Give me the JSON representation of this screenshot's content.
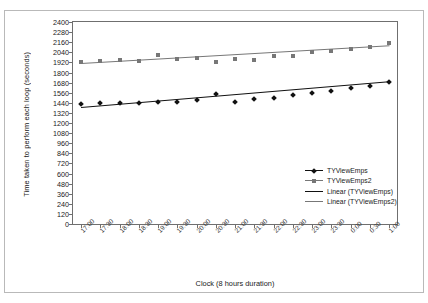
{
  "chart_data": {
    "type": "scatter",
    "title": "",
    "xlabel": "Clock (8 hours duration)",
    "ylabel": "Time taken to perform each loop (seconds)",
    "ylim": [
      0,
      2400
    ],
    "ytick_step": 120,
    "yticks": [
      2400,
      2280,
      2160,
      2040,
      1920,
      1800,
      1680,
      1560,
      1440,
      1320,
      1200,
      1080,
      960,
      840,
      720,
      600,
      480,
      360,
      240,
      120,
      0
    ],
    "categories": [
      "17:00",
      "17:30",
      "18:00",
      "18:30",
      "19:00",
      "19:30",
      "20:00",
      "20:30",
      "21:00",
      "21:30",
      "22:00",
      "22:30",
      "23:00",
      "23:30",
      "0:00",
      "0:30",
      "1:00"
    ],
    "grid": false,
    "legend_position": "inside-right",
    "series": [
      {
        "name": "TYViewEmps",
        "marker": "diamond",
        "color": "#111111",
        "values": [
          1428,
          1440,
          1435,
          1437,
          1452,
          1446,
          1470,
          1542,
          1448,
          1490,
          1500,
          1534,
          1556,
          1582,
          1614,
          1638,
          1690
        ]
      },
      {
        "name": "TYViewEmps2",
        "marker": "square",
        "color": "#777777",
        "values": [
          1930,
          1932,
          1944,
          1940,
          2002,
          1966,
          1974,
          1924,
          1966,
          1950,
          1992,
          1994,
          2046,
          2060,
          2082,
          2108,
          2152
        ]
      }
    ],
    "trendlines": [
      {
        "name": "Linear (TYViewEmps)",
        "color": "#111111",
        "y_start": 1388,
        "y_end": 1694
      },
      {
        "name": "Linear (TYViewEmps2)",
        "color": "#777777",
        "y_start": 1918,
        "y_end": 2130
      }
    ]
  },
  "legend": {
    "items": [
      {
        "label": "TYViewEmps",
        "kind": "marker-line",
        "marker": "diamond",
        "color": "#111111"
      },
      {
        "label": "TYViewEmps2",
        "kind": "marker-line",
        "marker": "square",
        "color": "#777777"
      },
      {
        "label": "Linear (TYViewEmps)",
        "kind": "line",
        "marker": "none",
        "color": "#111111"
      },
      {
        "label": "Linear (TYViewEmps2)",
        "kind": "line",
        "marker": "none",
        "color": "#777777"
      }
    ]
  }
}
